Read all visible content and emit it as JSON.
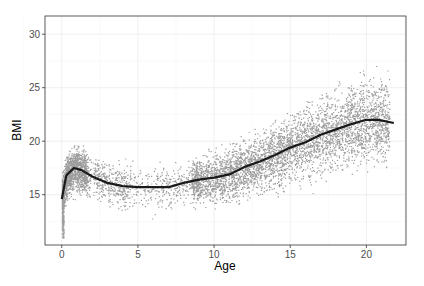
{
  "chart_data": {
    "type": "scatter",
    "title": "",
    "xlabel": "Age",
    "ylabel": "BMI",
    "xlim": [
      -1.1,
      22.6
    ],
    "ylim": [
      10.3,
      31.7
    ],
    "xticks": [
      0,
      5,
      10,
      15,
      20
    ],
    "yticks": [
      15,
      20,
      25,
      30
    ],
    "grid": true,
    "legend": null,
    "series": [
      {
        "name": "observations",
        "kind": "points",
        "color": "#8c8c8c",
        "description": "Dense scatter of several thousand points; BMI ~11-23 at age 0-1, spread 13-21 ages 1-9, rising spread 14-30 ages 10-21"
      },
      {
        "name": "smooth",
        "kind": "line",
        "color": "#1a1a1a",
        "x": [
          0,
          0.3,
          0.8,
          1.3,
          2,
          3,
          4,
          5,
          6,
          7,
          8,
          9,
          10,
          11,
          12,
          13,
          14,
          15,
          16,
          17,
          18,
          19,
          20,
          20.8,
          21.8
        ],
        "y": [
          14.6,
          16.8,
          17.5,
          17.3,
          16.7,
          16.1,
          15.8,
          15.7,
          15.7,
          15.7,
          16.1,
          16.4,
          16.6,
          16.9,
          17.6,
          18.1,
          18.7,
          19.4,
          19.9,
          20.6,
          21.1,
          21.6,
          22.0,
          22.0,
          21.7
        ]
      }
    ]
  }
}
